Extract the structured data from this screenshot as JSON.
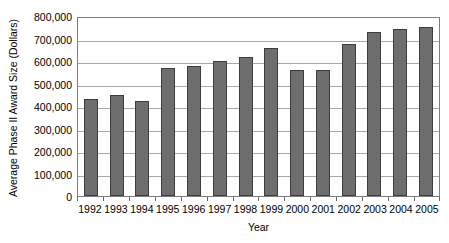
{
  "chart_data": {
    "type": "bar",
    "title": "",
    "subtitle": "",
    "xlabel": "Year",
    "ylabel": "Average Phase II Award Size (Dollars)",
    "categories": [
      "1992",
      "1993",
      "1994",
      "1995",
      "1996",
      "1997",
      "1998",
      "1999",
      "2000",
      "2001",
      "2002",
      "2003",
      "2004",
      "2005"
    ],
    "values": [
      430000,
      448000,
      423000,
      570000,
      578000,
      600000,
      620000,
      657000,
      560000,
      562000,
      675000,
      727000,
      742000,
      752000
    ],
    "ylim": [
      0,
      800000
    ],
    "ytick_values": [
      0,
      100000,
      200000,
      300000,
      400000,
      500000,
      600000,
      700000,
      800000
    ],
    "ytick_labels": [
      "0",
      "100,000",
      "200,000",
      "300,000",
      "400,000",
      "500,000",
      "600,000",
      "700,000",
      "800,000"
    ],
    "grid": true,
    "grid_axis": "y",
    "legend": false,
    "legend_position": "none",
    "bar_color": "#6e6e6e",
    "bar_border_color": "#3d3d3d",
    "gridline_color": "#a9a9a9",
    "plot_border_color": "#7d7d7d",
    "background_color": "#ffffff",
    "text_color": "#000000"
  }
}
